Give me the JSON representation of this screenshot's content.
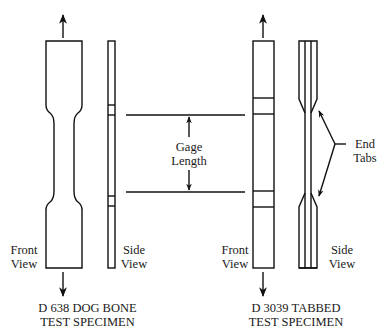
{
  "diagram": {
    "line_color": "#111111",
    "background": "#ffffff",
    "left_specimen": {
      "front_view_label_line1": "Front",
      "front_view_label_line2": "View",
      "side_view_label_line1": "Side",
      "side_view_label_line2": "View",
      "caption_line1": "D 638 DOG BONE",
      "caption_line2": "TEST SPECIMEN"
    },
    "gage": {
      "label_line1": "Gage",
      "label_line2": "Length"
    },
    "right_specimen": {
      "front_view_label_line1": "Front",
      "front_view_label_line2": "View",
      "side_view_label_line1": "Side",
      "side_view_label_line2": "View",
      "end_tabs_label_line1": "End",
      "end_tabs_label_line2": "Tabs",
      "caption_line1": "D 3039 TABBED",
      "caption_line2": "TEST SPECIMEN"
    }
  }
}
